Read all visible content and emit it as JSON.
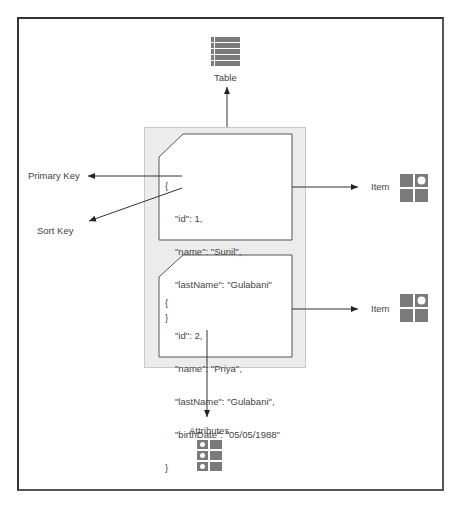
{
  "diagram": {
    "table": {
      "label": "Table",
      "icon": "table-icon"
    },
    "primary_key": {
      "label": "Primary Key"
    },
    "sort_key": {
      "label": "Sort Key"
    },
    "items": [
      {
        "label": "Item",
        "icon": "item-icon",
        "json_lines": [
          "{",
          "  \"id\": 1,",
          "  \"name\": \"Sunil\",",
          "  \"lastName\": \"Gulabani\"",
          "}"
        ]
      },
      {
        "label": "Item",
        "icon": "item-icon",
        "json_lines": [
          "{",
          "  \"id\": 2,",
          "  \"name\": \"Priya\",",
          "  \"lastName\": \"Gulabani\",",
          "  \"birthDate\": \"05/05/1988\"",
          "}"
        ]
      }
    ],
    "attributes": {
      "label": "Attributes",
      "icon": "attributes-icon"
    },
    "colors": {
      "icon_gray": "#7a7a7a",
      "line": "#333333",
      "container_bg": "#ececec"
    }
  }
}
